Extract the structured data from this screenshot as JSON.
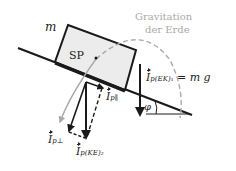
{
  "diagram": {
    "mass_label": "m",
    "center_label": "SP",
    "gravity_label_line1": "Gravitation",
    "gravity_label_line2": "der Erde",
    "angle_label": "φ",
    "vectors": {
      "ek1": {
        "symbol": "I",
        "subscript": "p(EK)₁",
        "suffix": "= m g"
      },
      "parallel": {
        "symbol": "I",
        "subscript": "p∥"
      },
      "perpendicular": {
        "symbol": "I",
        "subscript": "p⊥"
      },
      "ke2": {
        "symbol": "I",
        "subscript": "p(KE)₂"
      }
    },
    "colors": {
      "line": "#1a1a1a",
      "block_fill": "#ececec",
      "gravity_arc": "#aaaaaa",
      "gravity_text": "#aaaaaa"
    }
  }
}
